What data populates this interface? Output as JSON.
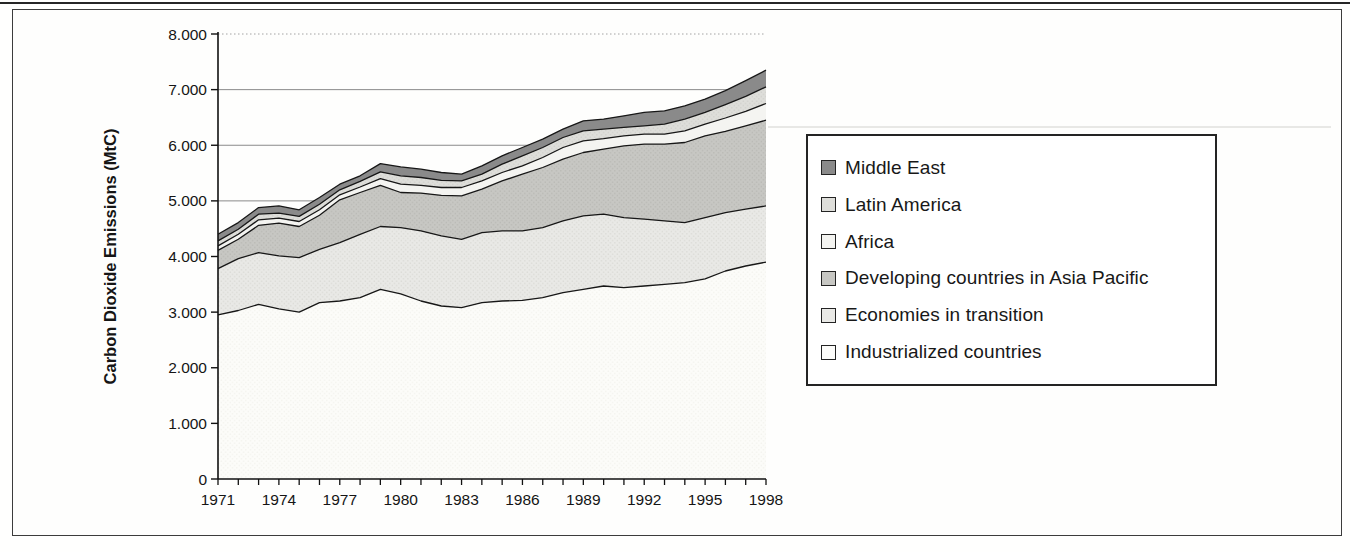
{
  "y_axis": {
    "title": "Carbon Dioxide Emissions (MtC)",
    "tick_labels": [
      "0",
      "1.000",
      "2.000",
      "3.000",
      "4.000",
      "5.000",
      "6.000",
      "7.000",
      "8.000"
    ]
  },
  "x_axis": {
    "tick_labels": [
      "1971",
      "1974",
      "1977",
      "1980",
      "1983",
      "1986",
      "1989",
      "1992",
      "1995",
      "1998"
    ]
  },
  "legend": {
    "items": [
      {
        "label": "Middle East",
        "swatch": "#8a8a8a",
        "texture": "solid"
      },
      {
        "label": "Latin America",
        "swatch": "#dededa",
        "texture": "dots"
      },
      {
        "label": "Africa",
        "swatch": "#f4f4f1",
        "texture": "solid"
      },
      {
        "label": "Developing countries in Asia Pacific",
        "swatch": "#c7c7c3",
        "texture": "dots"
      },
      {
        "label": "Economies in transition",
        "swatch": "#e9e9e6",
        "texture": "dots"
      },
      {
        "label": "Industrialized countries",
        "swatch": "#fdfdfb",
        "texture": "solid"
      }
    ]
  },
  "chart_data": {
    "type": "area",
    "stacked": true,
    "title": "",
    "xlabel": "",
    "ylabel": "Carbon Dioxide Emissions (MtC)",
    "unit": "MtC",
    "ylim": [
      0,
      8000
    ],
    "x_range": [
      1971,
      1998
    ],
    "grid": true,
    "legend_position": "right",
    "years": [
      1971,
      1972,
      1973,
      1974,
      1975,
      1976,
      1977,
      1978,
      1979,
      1980,
      1981,
      1982,
      1983,
      1984,
      1985,
      1986,
      1987,
      1988,
      1989,
      1990,
      1991,
      1992,
      1993,
      1994,
      1995,
      1996,
      1997,
      1998
    ],
    "y_tick_labels": [
      "0",
      "1.000",
      "2.000",
      "3.000",
      "4.000",
      "5.000",
      "6.000",
      "7.000",
      "8.000"
    ],
    "x_tick_labels": [
      "1971",
      "1974",
      "1977",
      "1980",
      "1983",
      "1986",
      "1989",
      "1992",
      "1995",
      "1998"
    ],
    "series": [
      {
        "name": "Industrialized countries",
        "fill": "#fcfcf9",
        "dot": "#efefe9",
        "values": [
          2950,
          3030,
          3140,
          3060,
          3000,
          3170,
          3200,
          3260,
          3410,
          3330,
          3200,
          3110,
          3080,
          3170,
          3200,
          3210,
          3260,
          3350,
          3410,
          3470,
          3440,
          3470,
          3500,
          3530,
          3600,
          3740,
          3830,
          3900
        ]
      },
      {
        "name": "Economies in transition",
        "fill": "#e9e9e6",
        "dot": "#d4d4cf",
        "values": [
          830,
          930,
          930,
          950,
          980,
          960,
          1050,
          1140,
          1130,
          1190,
          1260,
          1260,
          1230,
          1260,
          1260,
          1250,
          1260,
          1290,
          1320,
          1290,
          1260,
          1200,
          1140,
          1080,
          1100,
          1050,
          1020,
          1010
        ]
      },
      {
        "name": "Developing countries in Asia Pacific",
        "fill": "#c7c7c3",
        "dot": "#b2b2ad",
        "values": [
          330,
          350,
          490,
          590,
          560,
          610,
          770,
          750,
          740,
          630,
          680,
          730,
          780,
          780,
          900,
          1020,
          1080,
          1110,
          1140,
          1170,
          1290,
          1350,
          1380,
          1440,
          1470,
          1460,
          1500,
          1540
        ]
      },
      {
        "name": "Africa",
        "fill": "#f4f4f1",
        "dot": null,
        "values": [
          80,
          90,
          100,
          90,
          90,
          100,
          90,
          100,
          120,
          150,
          140,
          140,
          150,
          150,
          150,
          150,
          180,
          210,
          210,
          190,
          180,
          180,
          180,
          210,
          210,
          240,
          260,
          300
        ]
      },
      {
        "name": "Latin America",
        "fill": "#dededa",
        "dot": "#cbcbc6",
        "values": [
          90,
          90,
          100,
          90,
          90,
          100,
          90,
          100,
          120,
          150,
          140,
          130,
          120,
          120,
          150,
          180,
          180,
          180,
          180,
          170,
          150,
          150,
          180,
          210,
          210,
          240,
          270,
          300
        ]
      },
      {
        "name": "Middle East",
        "fill": "#8a8a8a",
        "dot": null,
        "values": [
          120,
          120,
          120,
          130,
          120,
          120,
          100,
          100,
          150,
          160,
          150,
          140,
          120,
          150,
          150,
          150,
          150,
          150,
          180,
          180,
          210,
          240,
          240,
          240,
          240,
          250,
          280,
          300
        ]
      }
    ]
  }
}
